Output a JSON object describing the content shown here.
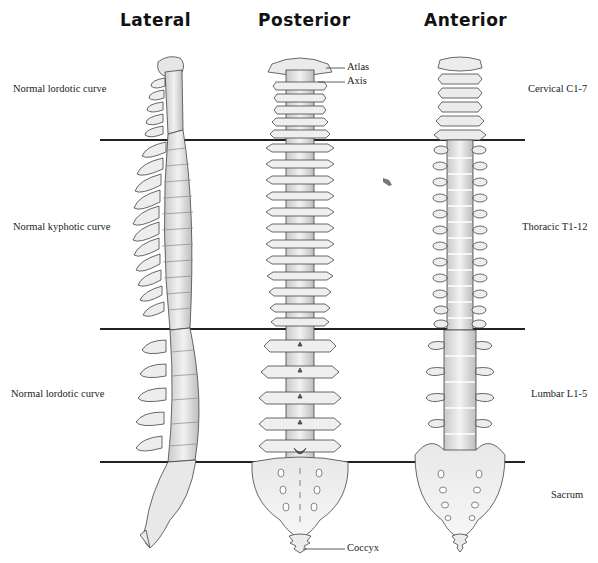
{
  "titles": {
    "lateral": "Lateral",
    "posterior": "Posterior",
    "anterior": "Anterior"
  },
  "left_labels": {
    "cervical_curve": "Normal lordotic curve",
    "thoracic_curve": "Normal kyphotic curve",
    "lumbar_curve": "Normal lordotic curve"
  },
  "right_labels": {
    "cervical": "Cervical C1-7",
    "thoracic": "Thoracic T1-12",
    "lumbar": "Lumbar L1-5",
    "sacrum": "Sacrum"
  },
  "callouts": {
    "atlas": "Atlas",
    "axis": "Axis",
    "coccyx": "Coccyx"
  },
  "colors": {
    "bone": "#ececec",
    "bone_shade": "#c8c8c8",
    "outline": "#444444",
    "divider": "#222222"
  }
}
